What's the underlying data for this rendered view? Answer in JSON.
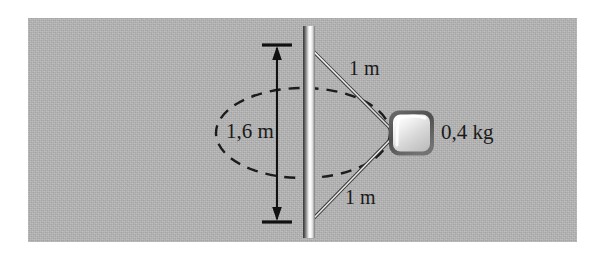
{
  "figure": {
    "name": "conical-pendulum-diagram",
    "background_color": "#ffffff",
    "panel_color": "#b6b6b6",
    "ink_color": "#1a1a1a"
  },
  "labels": {
    "circle_diameter": "1,6 m",
    "string_top": "1 m",
    "string_bottom": "1 m",
    "mass": "0,4 kg"
  },
  "elements": {
    "rod": {
      "name": "vertical-rod",
      "x": 304,
      "top_y": 26,
      "bottom_y": 238,
      "width": 11
    },
    "mass_block": {
      "name": "mass-block",
      "x": 389,
      "y": 110,
      "size": 45
    },
    "circle_path": {
      "name": "dashed-circle-path",
      "center_x": 303,
      "center_y": 133,
      "rx": 87,
      "ry": 45,
      "style": "dashed"
    },
    "dimension_line": {
      "name": "diameter-dimension-line",
      "x": 277,
      "top_y": 45,
      "bottom_y": 222
    },
    "string_top": {
      "name": "string-upper",
      "x1": 310,
      "y1": 48,
      "x2": 392,
      "y2": 132
    },
    "string_bottom": {
      "name": "string-lower",
      "x1": 310,
      "y1": 222,
      "x2": 392,
      "y2": 136
    }
  }
}
